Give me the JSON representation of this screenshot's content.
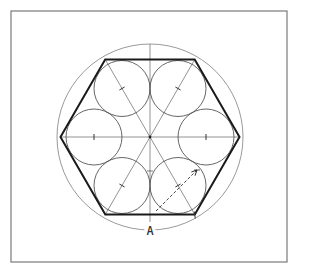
{
  "diagram": {
    "type": "hexagon-with-inscribed-circles",
    "frame": {
      "x": 11,
      "y": 11,
      "width": 276,
      "height": 251,
      "stroke": "#7a7a7a"
    },
    "center": {
      "x": 150,
      "y": 137
    },
    "outer_circle": {
      "r": 93,
      "stroke": "#9a9a9a"
    },
    "hexagon": {
      "r": 89.5,
      "stroke": "#1a1a1a",
      "stroke_width": 2
    },
    "small_circles": {
      "count": 6,
      "ring_radius": 56,
      "r": 28,
      "stroke": "#555555"
    },
    "construction_lines": {
      "stroke": "#777777"
    },
    "dimension": {
      "label": "A",
      "label_x": 150,
      "label_y": 231
    },
    "arrow": {
      "from": {
        "x": 156,
        "y": 211
      },
      "to": {
        "x": 197,
        "y": 170
      },
      "dashed": true
    }
  }
}
